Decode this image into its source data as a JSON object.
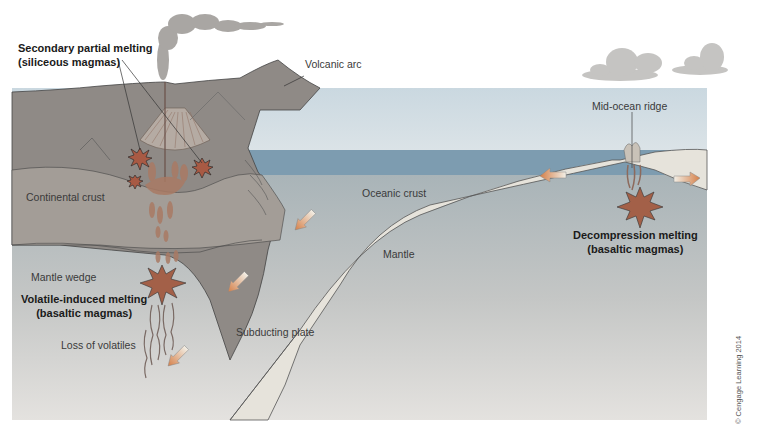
{
  "diagram": {
    "type": "cross-section",
    "colors": {
      "sky": "#cfd9df",
      "ocean": "#7f9fb3",
      "land": "#8e8a86",
      "continental_crust": "#a09a94",
      "mantle_top": "#b5b0ac",
      "mantle_bottom": "#e0dedb",
      "oceanic_crust": "#e7e4dc",
      "magma": "#b06a4a",
      "arrow": "#d98a55",
      "smoke": "#a9a6a3",
      "cloud": "#c8c7c5"
    }
  },
  "labels": {
    "secondary_melting": {
      "line1": "Secondary partial melting",
      "line2": "(siliceous magmas)"
    },
    "volcanic_arc": "Volcanic arc",
    "mid_ocean_ridge": "Mid-ocean ridge",
    "continental_crust": "Continental crust",
    "oceanic_crust": "Oceanic crust",
    "mantle": "Mantle",
    "mantle_wedge": "Mantle wedge",
    "volatile_melting": {
      "line1": "Volatile-induced melting",
      "line2": "(basaltic magmas)"
    },
    "decompression_melting": {
      "line1": "Decompression melting",
      "line2": "(basaltic magmas)"
    },
    "loss_of_volatiles": "Loss of volatiles",
    "subducting_plate": "Subducting plate"
  },
  "copyright": "© Cengage Learning  2014"
}
